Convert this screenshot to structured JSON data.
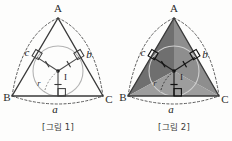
{
  "figures": [
    {
      "id": "figure-1",
      "caption": "[그림 1]",
      "vertices": {
        "a": "A",
        "b": "B",
        "c": "C"
      },
      "sides": {
        "a": "a",
        "b": "b",
        "c": "c"
      },
      "incenter_label": "I",
      "inradius_label": "r",
      "shaded": false
    },
    {
      "id": "figure-2",
      "caption": "[그림 2]",
      "vertices": {
        "a": "A",
        "b": "B",
        "c": "C"
      },
      "sides": {
        "a": "a",
        "b": "b",
        "c": "c"
      },
      "incenter_label": "I",
      "inradius_label": "r",
      "shaded": true
    }
  ],
  "colors": {
    "background": "#fdfdfc",
    "triangle_stroke": "#3a3a3a",
    "arc_stroke": "#555555",
    "incircle_stroke": "#a8a8a8",
    "radius_stroke": "#4a4a4a",
    "shade_left": "#6f6f6f",
    "shade_right": "#8e8e8e",
    "shade_bottom": "#9d9d9d",
    "text": "#2b2b2b"
  },
  "geometry": {
    "apex": {
      "x": 58,
      "y": 18
    },
    "left": {
      "x": 12,
      "y": 96
    },
    "right": {
      "x": 103,
      "y": 96
    },
    "incenter": {
      "x": 58,
      "y": 71
    },
    "inradius": 25
  }
}
